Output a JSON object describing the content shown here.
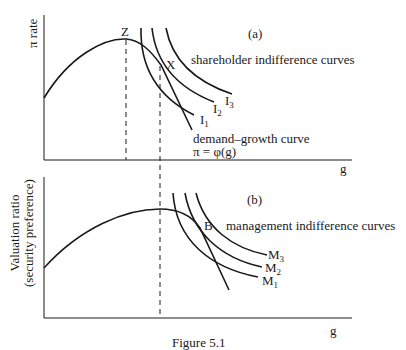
{
  "panel_a": {
    "tag": "(a)",
    "y_axis_label": "π rate",
    "x_axis_label": "g",
    "point_z": "Z",
    "point_x": "X",
    "indifference_label": "shareholder indifference curves",
    "curves": [
      {
        "name": "I",
        "sub": "1"
      },
      {
        "name": "I",
        "sub": "2"
      },
      {
        "name": "I",
        "sub": "3"
      }
    ],
    "demand_label": "demand–growth curve",
    "demand_formula": "π = φ(g)"
  },
  "panel_b": {
    "tag": "(b)",
    "y_axis_label_line1": "Valuation ratio",
    "y_axis_label_line2": "(security preference)",
    "x_axis_label": "g",
    "point_b": "B",
    "indifference_label": "management indifference curves",
    "curves": [
      {
        "name": "M",
        "sub": "1"
      },
      {
        "name": "M",
        "sub": "2"
      },
      {
        "name": "M",
        "sub": "3"
      }
    ]
  },
  "caption": "Figure 5.1"
}
